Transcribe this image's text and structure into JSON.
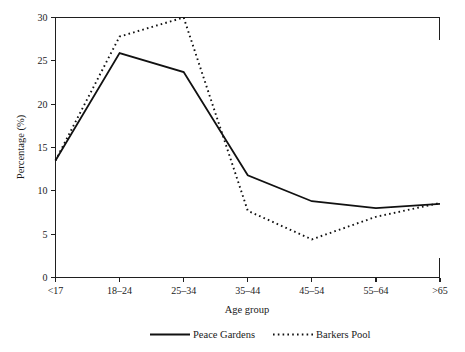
{
  "chart_data": {
    "type": "line",
    "title": "",
    "xlabel": "Age group",
    "ylabel": "Percentage (%)",
    "categories": [
      "<17",
      "18–24",
      "25–34",
      "35–44",
      "45–54",
      "55–64",
      ">65"
    ],
    "ylim": [
      0,
      30
    ],
    "yticks": [
      0,
      5,
      10,
      15,
      20,
      25,
      30
    ],
    "ytick_labels": [
      "0",
      "5",
      "10",
      "15",
      "20",
      "25",
      "30"
    ],
    "grid": false,
    "legend_position": "bottom-center",
    "series": [
      {
        "name": "Peace Gardens",
        "style": "solid",
        "color": "#111111",
        "values": [
          13.5,
          25.9,
          23.7,
          11.8,
          8.8,
          8.0,
          8.5
        ]
      },
      {
        "name": "Barkers Pool",
        "style": "dotted",
        "color": "#111111",
        "values": [
          13.5,
          27.8,
          30.0,
          7.7,
          4.4,
          7.0,
          8.6
        ]
      }
    ]
  },
  "axes": {
    "y_title": "Percentage (%)",
    "x_title": "Age group"
  },
  "legend": {
    "items": [
      {
        "label": "Peace Gardens",
        "style": "solid"
      },
      {
        "label": "Barkers Pool",
        "style": "dotted"
      }
    ]
  }
}
